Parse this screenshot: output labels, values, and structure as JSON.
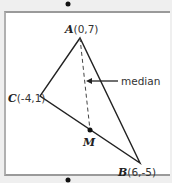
{
  "diagram": {
    "type": "triangle-median",
    "points": {
      "A": {
        "name": "A",
        "coords": "(0,7)"
      },
      "B": {
        "name": "B",
        "coords": "(6,-5)"
      },
      "C": {
        "name": "C",
        "coords": "(-4,1)"
      },
      "M": {
        "name": "M"
      }
    },
    "annotation": {
      "label": "median"
    },
    "colors": {
      "line": "#222222",
      "frame": "#9a9a9a",
      "background": "#ffffff"
    }
  }
}
